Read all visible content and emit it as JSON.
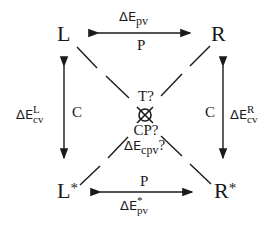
{
  "diagram": {
    "nodes": {
      "top_left": {
        "label": "L"
      },
      "top_right": {
        "label": "R"
      },
      "bottom_left": {
        "label": "L",
        "superscript": "*"
      },
      "bottom_right": {
        "label": "R",
        "superscript": "*"
      }
    },
    "edges": {
      "top": {
        "above": {
          "base": "ΔE",
          "sub": "pv"
        },
        "below": "P",
        "direction": "bidirectional"
      },
      "bottom": {
        "above": "P",
        "below": {
          "base": "ΔE",
          "sub": "pv",
          "sup": "*"
        },
        "direction": "bidirectional"
      },
      "left": {
        "outer": {
          "base": "ΔE",
          "sub": "cv",
          "sup": "L"
        },
        "inner": "C",
        "direction": "bidirectional"
      },
      "right": {
        "inner": "C",
        "outer": {
          "base": "ΔE",
          "sub": "cv",
          "sup": "R"
        },
        "direction": "bidirectional"
      },
      "diagonals": [
        "L–R*",
        "R–L*"
      ]
    },
    "center": {
      "top": "T?",
      "symbol": "crossed-circle",
      "mid": "CP?",
      "bottom": {
        "base": "ΔE",
        "sub": "cpv",
        "suffix": "?"
      }
    },
    "colors": {
      "ink": "#1a1a1a",
      "background": "#ffffff"
    }
  }
}
